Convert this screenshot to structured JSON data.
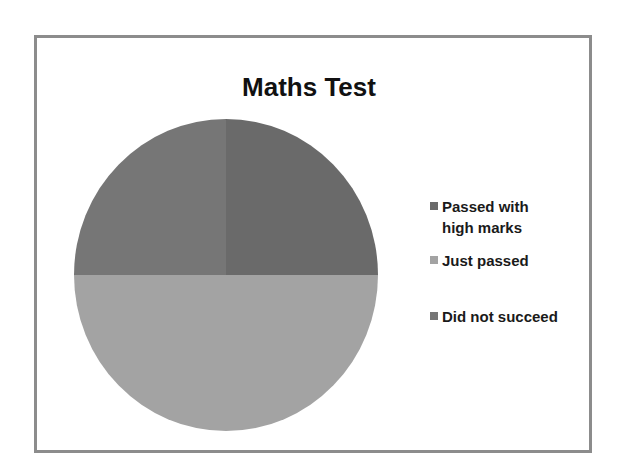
{
  "chart_data": {
    "type": "pie",
    "title": "Maths Test",
    "categories": [
      "Passed with high marks",
      "Just passed",
      "Did not succeed"
    ],
    "values": [
      25,
      50,
      25
    ],
    "unit": "%",
    "colors": [
      "#6a6a6a",
      "#a3a3a3",
      "#767676"
    ],
    "start_angle_deg": 90,
    "direction": "clockwise",
    "legend": {
      "position": "right",
      "entries": [
        {
          "label": "Passed with high marks",
          "label_lines": [
            "Passed with",
            "high marks"
          ],
          "color": "#6a6a6a"
        },
        {
          "label": "Just passed",
          "label_lines": [
            "Just passed"
          ],
          "color": "#a3a3a3"
        },
        {
          "label": "Did not succeed",
          "label_lines": [
            "Did not succeed"
          ],
          "color": "#767676"
        }
      ]
    },
    "data_labels": false,
    "border": true
  },
  "title": "Maths Test",
  "legend": {
    "items": [
      {
        "label": "Passed with high marks",
        "color": "#6a6a6a"
      },
      {
        "label": "Just passed",
        "color": "#a3a3a3"
      },
      {
        "label": "Did not succeed",
        "color": "#767676"
      }
    ]
  },
  "colors": {
    "frame_border": "#8c8c8c",
    "background": "#ffffff",
    "text": "#1a1a1a"
  }
}
